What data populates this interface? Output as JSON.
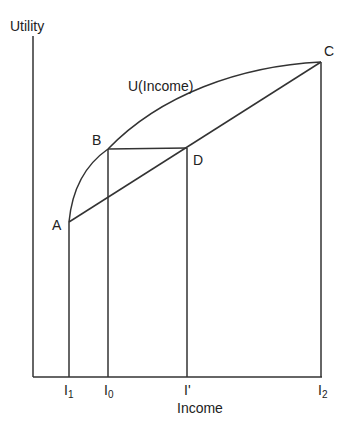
{
  "diagram": {
    "y_axis_label": "Utility",
    "x_axis_label": "Income",
    "curve_label": "U(Income)",
    "points": {
      "A": "A",
      "B": "B",
      "C": "C",
      "D": "D"
    },
    "ticks": {
      "I1": {
        "base": "I",
        "sub": "1"
      },
      "I0": {
        "base": "I",
        "sub": "0"
      },
      "Iprime": {
        "base": "I'",
        "sub": ""
      },
      "I2": {
        "base": "I",
        "sub": "2"
      }
    },
    "line_color": "#333333"
  }
}
